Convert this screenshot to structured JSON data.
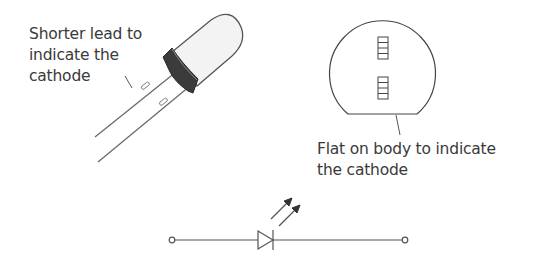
{
  "diagram": {
    "labels": {
      "shorter_lead": [
        "Shorter lead to",
        "indicate the",
        "cathode"
      ],
      "flat_body": [
        "Flat on body to indicate",
        "the cathode"
      ]
    },
    "components": {
      "led_side_view": "led-3d-icon",
      "led_top_view": "led-top-view-icon",
      "led_schematic_symbol": "led-symbol-icon"
    },
    "colors": {
      "line": "#4a4a4a",
      "text": "#3a3a3a",
      "collar": "#3c3c3c",
      "lens": "#f2f2f2"
    }
  }
}
